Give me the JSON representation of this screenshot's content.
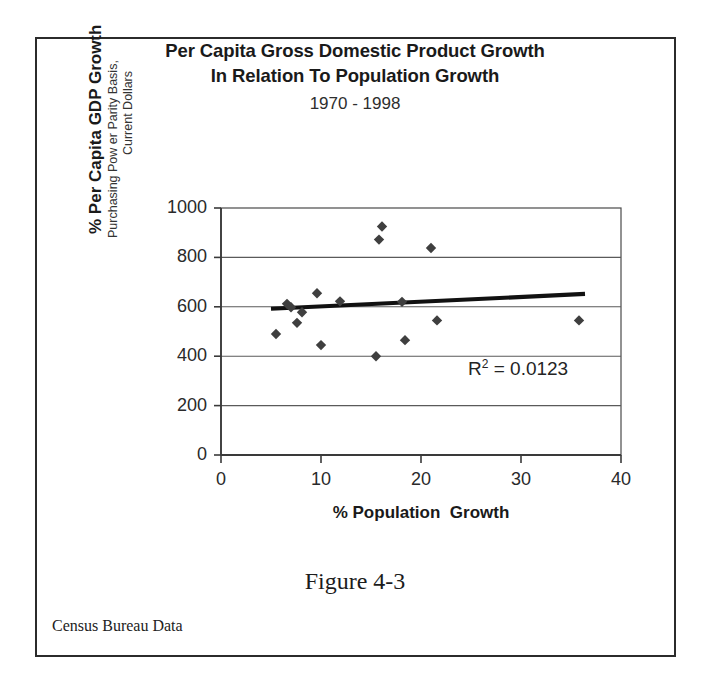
{
  "figure": {
    "caption": "Figure 4-3",
    "source_note": "Census Bureau Data",
    "frame_color": "#2b2b2b"
  },
  "chart_data": {
    "type": "scatter",
    "title": "Per Capita Gross Domestic Product Growth In Relation To Population Growth",
    "title_line1": "Per Capita Gross Domestic Product Growth",
    "title_line2": "In Relation To Population Growth",
    "subtitle": "1970 - 1998",
    "xlabel": "% Population  Growth",
    "ylabel": "% Per Capita GDP Growth",
    "ylabel_sub_line1": "Purchasing Pow er Parity Basis,",
    "ylabel_sub_line2": "Current Dollars",
    "xlim": [
      0,
      40
    ],
    "ylim": [
      0,
      1000
    ],
    "xticks": [
      0,
      10,
      20,
      30,
      40
    ],
    "yticks": [
      0,
      200,
      400,
      600,
      800,
      1000
    ],
    "grid": "horizontal",
    "legend": "none",
    "marker": "diamond",
    "marker_color": "#3f3f3f",
    "points": [
      {
        "x": 5.5,
        "y": 490
      },
      {
        "x": 6.6,
        "y": 612
      },
      {
        "x": 7.0,
        "y": 598
      },
      {
        "x": 7.6,
        "y": 535
      },
      {
        "x": 8.1,
        "y": 578
      },
      {
        "x": 9.6,
        "y": 655
      },
      {
        "x": 10.0,
        "y": 445
      },
      {
        "x": 11.9,
        "y": 622
      },
      {
        "x": 15.5,
        "y": 400
      },
      {
        "x": 15.8,
        "y": 872
      },
      {
        "x": 16.1,
        "y": 925
      },
      {
        "x": 18.1,
        "y": 620
      },
      {
        "x": 18.4,
        "y": 465
      },
      {
        "x": 21.0,
        "y": 838
      },
      {
        "x": 21.6,
        "y": 545
      },
      {
        "x": 35.8,
        "y": 545
      }
    ],
    "trendline": {
      "type": "linear",
      "x_start": 5.0,
      "y_start": 592,
      "x_end": 36.4,
      "y_end": 652,
      "color": "#111111"
    },
    "annotation": {
      "r_squared_prefix": "R",
      "r_squared_exponent": "2",
      "r_squared_value": " = 0.0123"
    }
  }
}
